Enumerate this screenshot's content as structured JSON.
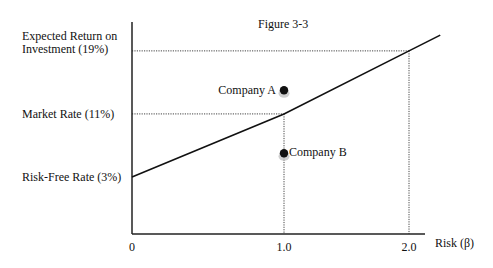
{
  "chart_data": {
    "type": "line",
    "title": "Figure 3-3",
    "xlabel": "Risk (β)",
    "ylabel": "",
    "x_ticks": [
      {
        "value": 0,
        "label": "0"
      },
      {
        "value": 1.0,
        "label": "1.0"
      },
      {
        "value": 2.0,
        "label": "2.0"
      }
    ],
    "y_levels": [
      {
        "value": 19,
        "label_lines": [
          "Expected Return on",
          "Investment (19%)"
        ]
      },
      {
        "value": 11,
        "label_lines": [
          "Market Rate (11%)"
        ]
      },
      {
        "value": 3,
        "label_lines": [
          "Risk-Free Rate (3%)"
        ]
      }
    ],
    "series": [
      {
        "name": "Security Market Line",
        "x": [
          0,
          1.0,
          2.0,
          2.25
        ],
        "y": [
          3,
          11,
          19,
          21
        ]
      }
    ],
    "reference_lines": [
      {
        "type": "horizontal",
        "y": 19,
        "x_to": 2.0,
        "style": "dotted"
      },
      {
        "type": "horizontal",
        "y": 11,
        "x_to": 1.0,
        "style": "dotted"
      },
      {
        "type": "vertical",
        "x": 1.0,
        "y_to": 11,
        "style": "dotted"
      },
      {
        "type": "vertical",
        "x": 2.0,
        "y_to": 19,
        "style": "dotted"
      }
    ],
    "points": [
      {
        "label": "Company A",
        "x": 1.0,
        "y": 14,
        "label_side": "left"
      },
      {
        "label": "Company B",
        "x": 1.0,
        "y": 6,
        "label_side": "right"
      }
    ],
    "grid": false,
    "legend": "none"
  }
}
